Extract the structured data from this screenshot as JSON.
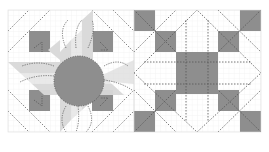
{
  "figure": {
    "colors": {
      "background": "#ffffff",
      "grid": "#e6e6e6",
      "dark": "#8e8e8e",
      "light": "#d9d9d9",
      "stitch": "#555555"
    },
    "blocks": [
      {
        "name": "sunflower-block",
        "x": 8,
        "y": 10,
        "size": 126,
        "grid": 6,
        "center_circle": {
          "cx": 71,
          "cy": 71,
          "r": 25
        },
        "dark_squares": [
          [
            1,
            1
          ],
          [
            4,
            1
          ],
          [
            1,
            4
          ],
          [
            4,
            4
          ]
        ]
      },
      {
        "name": "star-block",
        "x": 134,
        "y": 10,
        "size": 126,
        "grid": 6,
        "dark_cells": [
          [
            0,
            0
          ],
          [
            5,
            0
          ],
          [
            1,
            1
          ],
          [
            4,
            1
          ],
          [
            1,
            4
          ],
          [
            4,
            4
          ],
          [
            0,
            5
          ],
          [
            5,
            5
          ],
          [
            2,
            2
          ],
          [
            3,
            2
          ],
          [
            2,
            3
          ],
          [
            3,
            3
          ]
        ]
      }
    ]
  }
}
